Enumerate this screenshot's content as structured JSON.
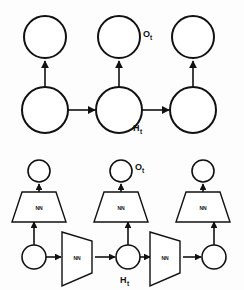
{
  "figure": {
    "background_color": "#fdfdfd",
    "stroke_color": "#111111",
    "fill_color": "#ffffff"
  },
  "labels": {
    "output_symbol": "O",
    "hidden_symbol": "H",
    "time_subscript": "t",
    "nn_block": "NN"
  },
  "top_diagram": {
    "name": "abstract-rnn-unrolled",
    "output_nodes": [
      {
        "id": "out-1",
        "cx": 45,
        "cy": 37,
        "r": 21
      },
      {
        "id": "out-2",
        "cx": 119,
        "cy": 37,
        "r": 21
      },
      {
        "id": "out-3",
        "cx": 193,
        "cy": 37,
        "r": 21
      }
    ],
    "hidden_nodes": [
      {
        "id": "hid-1",
        "cx": 45,
        "cy": 110,
        "r": 23
      },
      {
        "id": "hid-2",
        "cx": 119,
        "cy": 110,
        "r": 23
      },
      {
        "id": "hid-3",
        "cx": 193,
        "cy": 110,
        "r": 23
      }
    ],
    "vertical_edges": [
      {
        "id": "v-1",
        "x": 45,
        "y1": 87,
        "y2": 60
      },
      {
        "id": "v-2",
        "x": 119,
        "y1": 87,
        "y2": 60
      },
      {
        "id": "v-3",
        "x": 193,
        "y1": 87,
        "y2": 60
      }
    ],
    "horizontal_edges": [
      {
        "id": "h-1",
        "y": 110,
        "x1": 68,
        "x2": 94
      },
      {
        "id": "h-2",
        "y": 110,
        "x1": 142,
        "x2": 168
      }
    ],
    "annotations": [
      {
        "id": "ot-top",
        "text": "O",
        "sub": "t",
        "x": 143,
        "y": 34
      },
      {
        "id": "ht-top",
        "text": "H",
        "sub": "t",
        "x": 136,
        "y": 129
      }
    ]
  },
  "bottom_diagram": {
    "name": "expanded-rnn-with-nn-blocks",
    "output_nodes": [
      {
        "id": "b-out-1",
        "cx": 39,
        "cy": 171,
        "r": 11
      },
      {
        "id": "b-out-2",
        "cx": 121,
        "cy": 171,
        "r": 11
      },
      {
        "id": "b-out-3",
        "cx": 203,
        "cy": 171,
        "r": 11
      }
    ],
    "hidden_nodes": [
      {
        "id": "b-hid-1",
        "cx": 34,
        "cy": 257,
        "r": 12
      },
      {
        "id": "b-hid-2",
        "cx": 128,
        "cy": 257,
        "r": 12
      },
      {
        "id": "b-hid-3",
        "cx": 214,
        "cy": 257,
        "r": 12
      }
    ],
    "output_nn_blocks": [
      {
        "id": "nn-up-1",
        "cx": 39,
        "cy": 205,
        "label": "NN"
      },
      {
        "id": "nn-up-2",
        "cx": 121,
        "cy": 205,
        "label": "NN"
      },
      {
        "id": "nn-up-3",
        "cx": 203,
        "cy": 205,
        "label": "NN"
      }
    ],
    "recurrent_nn_blocks": [
      {
        "id": "nn-rec-1",
        "cx": 78,
        "cy": 257,
        "label": "NN"
      },
      {
        "id": "nn-rec-2",
        "cx": 166,
        "cy": 257,
        "label": "NN"
      }
    ],
    "annotations": [
      {
        "id": "ot-bottom",
        "text": "O",
        "sub": "t",
        "x": 136,
        "y": 168
      },
      {
        "id": "ht-bottom",
        "text": "H",
        "sub": "t",
        "x": 122,
        "y": 281
      }
    ]
  }
}
